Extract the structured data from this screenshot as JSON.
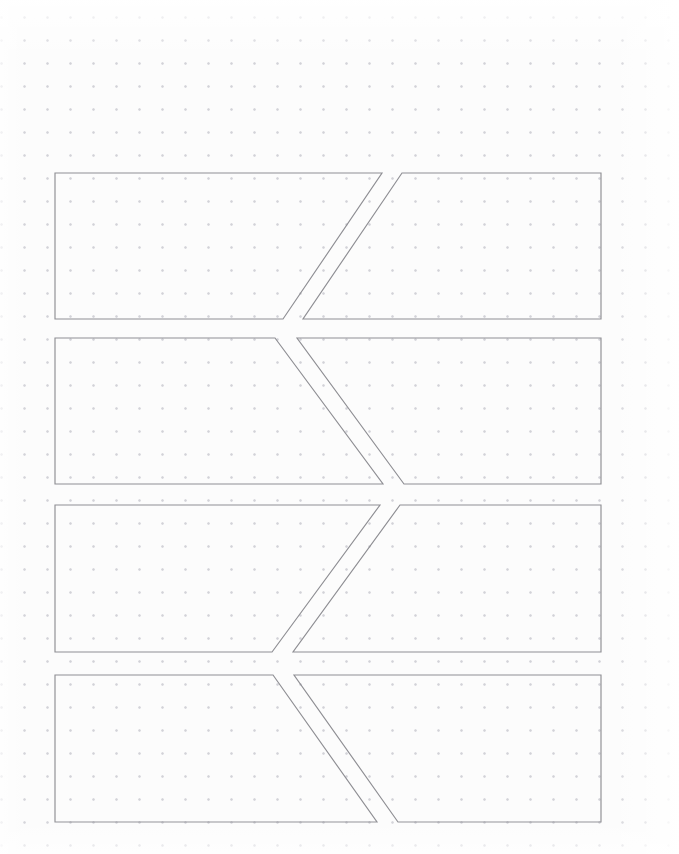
{
  "page": {
    "width": 679,
    "height": 854,
    "medium": "dot-grid-notebook-page",
    "background_color": "#fcfcfc"
  },
  "dot_grid": {
    "name": "dot-grid",
    "spacing_px": 23,
    "origin_x_px": 13,
    "origin_y_px": 6,
    "dot_color": "#d2d2d8",
    "dot_radius_px": 0.9,
    "columns": 30,
    "rows": 38
  },
  "drawing": {
    "name": "banner-ribbon-sketch",
    "stroke_color": "#8e8e93",
    "stroke_width_px": 1.15,
    "fill": "none",
    "description": "Four stacked horizontal banner bands, each split by a diagonal cut into a left piece and a right piece, with the diagonal direction alternating row to row.",
    "bounds": {
      "left": 55,
      "right": 601,
      "top": 173,
      "bottom": 822
    },
    "band_count": 4,
    "pieces_per_band": 2,
    "diagonal_gap_px": 20,
    "bands": [
      {
        "index": 1,
        "name": "banner-band-1",
        "top": 173,
        "bottom": 319,
        "diagonal": "up-right",
        "left_piece": {
          "name": "band-1-left-piece",
          "points": "55,173 382,173 283,319 55,319"
        },
        "right_piece": {
          "name": "band-1-right-piece",
          "points": "402,173 601,173 601,319 303,319"
        }
      },
      {
        "index": 2,
        "name": "banner-band-2",
        "top": 338,
        "bottom": 484,
        "diagonal": "down-right",
        "left_piece": {
          "name": "band-2-left-piece",
          "points": "55,338 275,338 383,484 55,484"
        },
        "right_piece": {
          "name": "band-2-right-piece",
          "points": "297,338 601,338 601,484 404,484"
        }
      },
      {
        "index": 3,
        "name": "banner-band-3",
        "top": 505,
        "bottom": 652,
        "diagonal": "up-right",
        "left_piece": {
          "name": "band-3-left-piece",
          "points": "55,505 380,505 272,652 55,652"
        },
        "right_piece": {
          "name": "band-3-right-piece",
          "points": "400,505 601,505 601,652 293,652"
        }
      },
      {
        "index": 4,
        "name": "banner-band-4",
        "top": 675,
        "bottom": 822,
        "diagonal": "down-right",
        "left_piece": {
          "name": "band-4-left-piece",
          "points": "55,675 273,675 377,822 55,822"
        },
        "right_piece": {
          "name": "band-4-right-piece",
          "points": "294,675 601,675 601,822 398,822"
        }
      }
    ]
  }
}
